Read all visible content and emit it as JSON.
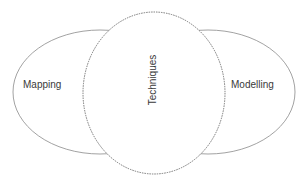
{
  "diagram": {
    "type": "venn-style",
    "labels": {
      "left": "Mapping",
      "center": "Techniques",
      "right": "Modelling"
    },
    "colors": {
      "stroke": "#8a8a8a",
      "dashed_stroke": "#6a6a6a",
      "text": "#3a3a3a",
      "background": "#ffffff"
    }
  }
}
